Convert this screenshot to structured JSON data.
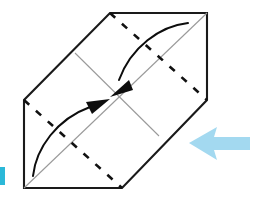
{
  "figure": {
    "canvas": {
      "width": 261,
      "height": 208,
      "background": "#ffffff"
    }
  },
  "sheet": {
    "name": "paper-sheet",
    "shape": "hexagon",
    "outline_color": "#1a1a1a",
    "fill_color": "#ffffff",
    "stroke_width": 2.1,
    "vertices": [
      {
        "label": "top-left",
        "x": 110,
        "y": 13
      },
      {
        "label": "top-right",
        "x": 207,
        "y": 13
      },
      {
        "label": "right",
        "x": 207,
        "y": 100
      },
      {
        "label": "bottom-right",
        "x": 122,
        "y": 188
      },
      {
        "label": "bottom-left",
        "x": 24,
        "y": 188
      },
      {
        "label": "left",
        "x": 24,
        "y": 100
      }
    ],
    "center": {
      "x": 116,
      "y": 97
    }
  },
  "fold_lines": [
    {
      "name": "fold-line-upper",
      "style": "dashed",
      "color": "#111111",
      "stroke_width": 2.6,
      "dash_pattern": "7 9",
      "from": {
        "x": 110,
        "y": 13
      },
      "to": {
        "x": 207,
        "y": 100
      }
    },
    {
      "name": "fold-line-lower",
      "style": "dashed",
      "color": "#111111",
      "stroke_width": 2.6,
      "dash_pattern": "7 9",
      "from": {
        "x": 24,
        "y": 100
      },
      "to": {
        "x": 122,
        "y": 188
      }
    }
  ],
  "guide_lines": [
    {
      "name": "guide-line-main-diagonal",
      "color": "#9a9a9a",
      "stroke_width": 1.1,
      "from": {
        "x": 24,
        "y": 188
      },
      "to": {
        "x": 207,
        "y": 13
      }
    },
    {
      "name": "guide-line-cross-diagonal",
      "color": "#9a9a9a",
      "stroke_width": 1.1,
      "from": {
        "x": 75,
        "y": 53
      },
      "to": {
        "x": 159,
        "y": 136
      }
    }
  ],
  "motion_arrows": [
    {
      "name": "motion-arrow-from-top-right",
      "color": "#0d0d0d",
      "stroke_width": 2.0,
      "direction": "down-left toward center",
      "path": "M 188 23 C 160 26 131 47 119 80",
      "head_points": "110,97 129,80 133,90"
    },
    {
      "name": "motion-arrow-from-bottom-left",
      "color": "#0d0d0d",
      "stroke_width": 2.0,
      "direction": "up-right toward center",
      "path": "M 33 176 C 36 148 57 119 90 107",
      "head_points": "110,99 92,114 86,102"
    }
  ],
  "hint_arrow": {
    "name": "next-step-arrow",
    "color": "#a3d9f0",
    "direction": "right",
    "points": "189,143 217,127 214,137 250,137 250,150 214,150 217,160",
    "bounds": {
      "x": 189,
      "y": 126,
      "width": 61,
      "height": 34
    }
  },
  "edge_marker": {
    "name": "left-edge-marker",
    "color": "#2bb8d8",
    "bounds": {
      "x": 0,
      "y": 167,
      "width": 5,
      "height": 18
    }
  }
}
